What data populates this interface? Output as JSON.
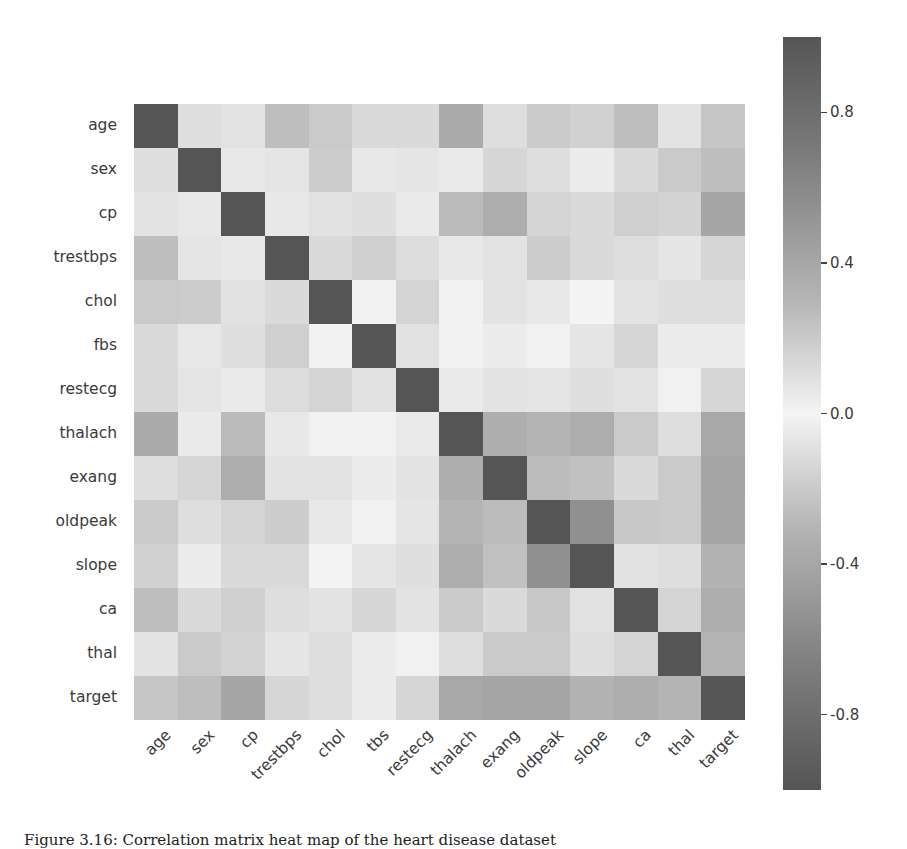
{
  "caption": "Figure 3.16: Correlation matrix heat map of the heart disease dataset",
  "chart_data": {
    "type": "heatmap",
    "title": "",
    "xlabel": "",
    "ylabel": "",
    "row_labels": [
      "age",
      "sex",
      "cp",
      "trestbps",
      "chol",
      "fbs",
      "restecg",
      "thalach",
      "exang",
      "oldpeak",
      "slope",
      "ca",
      "thal",
      "target"
    ],
    "col_labels": [
      "age",
      "sex",
      "cp",
      "trestbps",
      "chol",
      "tbs",
      "restecg",
      "thalach",
      "exang",
      "oldpeak",
      "slope",
      "ca",
      "thal",
      "target"
    ],
    "values": [
      [
        1.0,
        -0.1,
        -0.07,
        0.28,
        0.21,
        0.12,
        -0.12,
        -0.4,
        0.1,
        0.21,
        -0.17,
        0.28,
        0.07,
        -0.23
      ],
      [
        -0.1,
        1.0,
        -0.05,
        -0.06,
        -0.2,
        0.05,
        -0.06,
        -0.04,
        0.14,
        0.1,
        -0.03,
        0.12,
        0.21,
        -0.28
      ],
      [
        -0.07,
        -0.05,
        1.0,
        0.05,
        -0.08,
        0.09,
        0.04,
        0.3,
        -0.39,
        -0.15,
        0.12,
        -0.18,
        -0.16,
        0.43
      ],
      [
        0.28,
        -0.06,
        0.05,
        1.0,
        0.12,
        0.18,
        -0.11,
        -0.05,
        0.07,
        0.19,
        -0.12,
        0.1,
        0.06,
        -0.14
      ],
      [
        0.21,
        -0.2,
        -0.08,
        0.12,
        1.0,
        0.01,
        -0.15,
        -0.01,
        0.07,
        0.05,
        -0.0,
        0.07,
        0.1,
        -0.09
      ],
      [
        0.12,
        0.05,
        0.09,
        0.18,
        0.01,
        1.0,
        -0.08,
        -0.01,
        0.03,
        0.01,
        -0.06,
        0.14,
        -0.03,
        -0.03
      ],
      [
        -0.12,
        -0.06,
        0.04,
        -0.11,
        -0.15,
        -0.08,
        1.0,
        0.04,
        -0.07,
        -0.06,
        0.09,
        -0.07,
        -0.01,
        0.14
      ],
      [
        -0.4,
        -0.04,
        0.3,
        -0.05,
        -0.01,
        -0.01,
        0.04,
        1.0,
        -0.38,
        -0.34,
        0.39,
        -0.21,
        -0.1,
        0.42
      ],
      [
        0.1,
        0.14,
        -0.39,
        0.07,
        0.07,
        0.03,
        -0.07,
        -0.38,
        1.0,
        0.29,
        -0.26,
        0.12,
        0.21,
        -0.44
      ],
      [
        0.21,
        0.1,
        -0.15,
        0.19,
        0.05,
        0.01,
        -0.06,
        -0.34,
        0.29,
        1.0,
        -0.58,
        0.22,
        0.21,
        -0.43
      ],
      [
        -0.17,
        -0.03,
        0.12,
        -0.12,
        -0.0,
        -0.06,
        0.09,
        0.39,
        -0.26,
        -0.58,
        1.0,
        -0.08,
        -0.1,
        0.35
      ],
      [
        0.28,
        0.12,
        -0.18,
        0.1,
        0.07,
        0.14,
        -0.07,
        -0.21,
        0.12,
        0.22,
        -0.08,
        1.0,
        0.15,
        -0.39
      ],
      [
        0.07,
        0.21,
        -0.16,
        0.06,
        0.1,
        -0.03,
        -0.01,
        -0.1,
        0.21,
        0.21,
        -0.1,
        0.15,
        1.0,
        -0.34
      ],
      [
        -0.23,
        -0.28,
        0.43,
        -0.14,
        -0.09,
        -0.03,
        0.14,
        0.42,
        -0.44,
        -0.43,
        0.35,
        -0.39,
        -0.34,
        1.0
      ]
    ],
    "colorbar": {
      "range": [
        -1.0,
        1.0
      ],
      "ticks": [
        0.8,
        0.4,
        0.0,
        -0.4,
        -0.8
      ],
      "tick_labels": [
        "0.8",
        "0.4",
        "0.0",
        "-0.4",
        "-0.8"
      ],
      "colormap": "diverging grayscale (dark at +1 and -1, light at 0)"
    },
    "grid": false,
    "legend_position": "right (colorbar)"
  },
  "colors": {
    "extreme": "#555555",
    "zero": "#f4f4f4",
    "text": "#3a3a3a"
  }
}
